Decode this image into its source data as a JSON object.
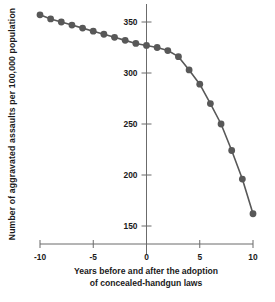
{
  "chart_data": {
    "type": "line",
    "title": "",
    "subtitle": "",
    "xlabel_line1": "Years before and after the adoption",
    "xlabel_line2": "of concealed-handgun laws",
    "xlabel": "Years before and after the adoption of concealed-handgun laws",
    "ylabel": "Number of aggravated assaults per 100,000 population",
    "xlim": [
      -10,
      10
    ],
    "ylim": [
      140,
      368
    ],
    "xticks": [
      -10,
      -5,
      0,
      5,
      10
    ],
    "xtick_labels": [
      "-10",
      "-5",
      "0",
      "5",
      "10"
    ],
    "yticks": [
      150,
      200,
      250,
      300,
      350
    ],
    "ytick_labels": [
      "150",
      "200",
      "250",
      "300",
      "350"
    ],
    "grid": false,
    "legend": false,
    "legend_position": "none",
    "marker": "circle",
    "marker_color": "#585858",
    "line_color": "#585858",
    "axis_color": "#6b6b6b",
    "background_color": "#ffffff",
    "x": [
      -10,
      -9,
      -8,
      -7,
      -6,
      -5,
      -4,
      -3,
      -2,
      -1,
      0,
      1,
      2,
      3,
      4,
      5,
      6,
      7,
      8,
      9,
      10
    ],
    "values": [
      357,
      353,
      350,
      347,
      344,
      341,
      338,
      335,
      332,
      329,
      327,
      325,
      322,
      316,
      303,
      289,
      270,
      250,
      224,
      196,
      162
    ],
    "series": [
      {
        "name": "Aggravated assaults",
        "x": [
          -10,
          -9,
          -8,
          -7,
          -6,
          -5,
          -4,
          -3,
          -2,
          -1,
          0,
          1,
          2,
          3,
          4,
          5,
          6,
          7,
          8,
          9,
          10
        ],
        "values": [
          357,
          353,
          350,
          347,
          344,
          341,
          338,
          335,
          332,
          329,
          327,
          325,
          322,
          316,
          303,
          289,
          270,
          250,
          224,
          196,
          162
        ]
      }
    ],
    "annotations": []
  }
}
